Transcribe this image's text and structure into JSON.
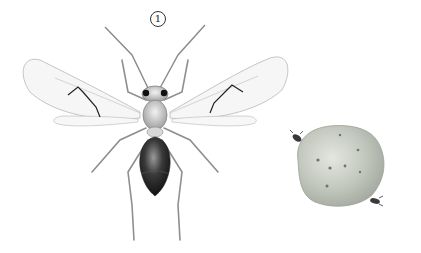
{
  "plate": {
    "figure_label": "1",
    "subjects": [
      {
        "name": "wasp",
        "view": "dorsal, wings spread"
      },
      {
        "name": "gall",
        "note": "rounded gall with two small insects"
      }
    ],
    "colors": {
      "background": "#ffffff",
      "line": "#8a8a8a",
      "vein_dark": "#222222",
      "abdomen": "#2a2a2a",
      "gall": "#c9cdc4"
    }
  }
}
